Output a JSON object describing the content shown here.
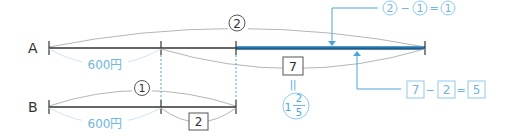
{
  "colors": {
    "line": "#333333",
    "arc": "#b5b5b5",
    "blue": "#4aa7dc",
    "blue_dark": "#1f5d8c",
    "blue_light": "#8fc9ea",
    "box_text": "#333333"
  },
  "rows": {
    "a": {
      "label": "A"
    },
    "b": {
      "label": "B"
    }
  },
  "labels": {
    "a_total_ratio": "2",
    "a_part_amount": "600円",
    "b_total_ratio": "1",
    "b_part_amount": "600円",
    "b_remainder_box": "2",
    "a_remainder_box": "7",
    "equals_vertical": "||",
    "mixed_whole": "1",
    "mixed_num": "2",
    "mixed_den": "5"
  },
  "callouts": {
    "ratio_diff": {
      "left": "2",
      "op": "−",
      "right": "1",
      "eq": "=",
      "result": "1"
    },
    "box_diff": {
      "left": "7",
      "op": "−",
      "right": "2",
      "eq": "=",
      "result": "5"
    }
  }
}
